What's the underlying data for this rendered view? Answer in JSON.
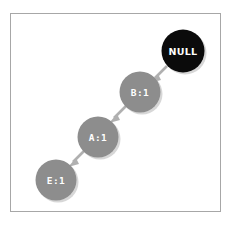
{
  "diagram": {
    "title": "",
    "frame": {
      "border_color": "#a7a7a7",
      "background": "#ffffff"
    },
    "colors": {
      "node_gray": "#8d8d8d",
      "node_black": "#0b0b0b",
      "node_text": "#ffffff",
      "edge": "#b0b0b0",
      "shadow": "#c9c9c9",
      "canvas": "#ffffff"
    },
    "nodes": [
      {
        "id": "null",
        "label": "NULL",
        "style": "black",
        "cx": 183,
        "cy": 51,
        "r": 21.5
      },
      {
        "id": "b",
        "label": "B:1",
        "style": "gray",
        "cx": 140,
        "cy": 92,
        "r": 20.5
      },
      {
        "id": "a",
        "label": "A:1",
        "style": "gray",
        "cx": 98,
        "cy": 137,
        "r": 20.5
      },
      {
        "id": "e",
        "label": "E:1",
        "style": "gray",
        "cx": 56,
        "cy": 180,
        "r": 20.5
      }
    ],
    "edges": [
      {
        "id": "null-to-b",
        "from": "null",
        "to": "b",
        "direction": "down-left"
      },
      {
        "id": "b-to-a",
        "from": "b",
        "to": "a",
        "direction": "down-left"
      },
      {
        "id": "a-to-e",
        "from": "a",
        "to": "e",
        "direction": "down-left"
      }
    ]
  }
}
